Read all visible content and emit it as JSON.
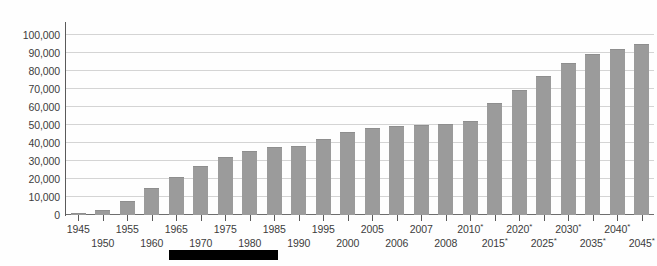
{
  "chart_data": {
    "type": "bar",
    "title": "",
    "subtitle": "",
    "xlabel": "",
    "ylabel": "",
    "ylim": [
      0,
      105000
    ],
    "yticks": [
      0,
      10000,
      20000,
      30000,
      40000,
      50000,
      60000,
      70000,
      80000,
      90000,
      100000
    ],
    "ytick_labels": [
      "0",
      "10,000",
      "20,000",
      "30,000",
      "40,000",
      "50,000",
      "60,000",
      "70,000",
      "80,000",
      "90,000",
      "100,000"
    ],
    "grid": true,
    "legend": "none",
    "bar_color": "#9b9b9b",
    "gridline_color": "#d4d4d4",
    "axis_color": "#5a5a5a",
    "background_color": "#fefefe",
    "categories": [
      "1945",
      "1950",
      "1955",
      "1960",
      "1965",
      "1970",
      "1975",
      "1980",
      "1985",
      "1990",
      "1995",
      "2000",
      "2005",
      "2006",
      "2007",
      "2008",
      "2010*",
      "2015*",
      "2020*",
      "2025*",
      "2030*",
      "2035*",
      "2040*",
      "2045*"
    ],
    "values": [
      1000,
      3000,
      8000,
      15000,
      21000,
      27000,
      32000,
      35500,
      38000,
      38500,
      42500,
      46000,
      48500,
      49500,
      50000,
      50500,
      52500,
      62000,
      69500,
      77500,
      84500,
      89500,
      92500,
      95000
    ],
    "projection_marker": "*",
    "projected_from": "2010*"
  },
  "overlay": {
    "redaction_label": "redaction-block"
  }
}
